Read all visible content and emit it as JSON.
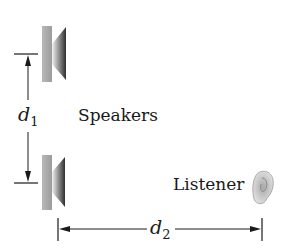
{
  "diagram": {
    "speakers_label": "Speakers",
    "listener_label": "Listener",
    "d1": {
      "symbol": "d",
      "subscript": "1"
    },
    "d2": {
      "symbol": "d",
      "subscript": "2"
    }
  },
  "colors": {
    "ink": "#1a1a1a",
    "speaker_box": "#a8a8a8",
    "speaker_cone_dark": "#3a3a3a",
    "speaker_cone_light": "#d8d8d8",
    "ear": "#c8c8c8",
    "ear_outline": "#9a9a9a"
  }
}
